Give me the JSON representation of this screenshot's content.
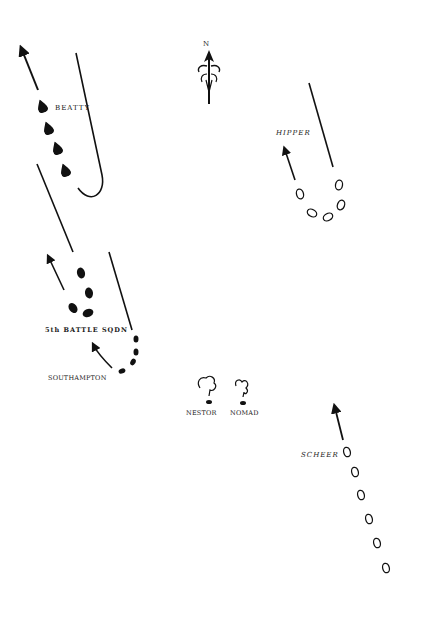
{
  "diagram": {
    "ink_color": "#111111",
    "compass": {
      "label": "N"
    },
    "labels": {
      "beatty": "BEATTY",
      "hipper": "HIPPER",
      "fifth_battle_sqdn": "5th BATTLE SQDN",
      "southampton": "SOUTHAMPTON",
      "nestor": "NESTOR",
      "nomad": "NOMAD",
      "scheer": "SCHEER"
    },
    "forces": [
      {
        "name": "BEATTY",
        "side": "British",
        "ship_style": "filled",
        "ships": 4
      },
      {
        "name": "HIPPER",
        "side": "German",
        "ship_style": "outline",
        "ships": 5
      },
      {
        "name": "5th BATTLE SQDN",
        "side": "British",
        "ship_style": "filled",
        "ships": 4
      },
      {
        "name": "SOUTHAMPTON",
        "side": "British",
        "ship_style": "filled",
        "ships": 4
      },
      {
        "name": "NESTOR",
        "side": "British",
        "ship_style": "sinking",
        "ships": 1
      },
      {
        "name": "NOMAD",
        "side": "British",
        "ship_style": "sinking",
        "ships": 1
      },
      {
        "name": "SCHEER",
        "side": "German",
        "ship_style": "outline",
        "ships": 6
      }
    ]
  }
}
